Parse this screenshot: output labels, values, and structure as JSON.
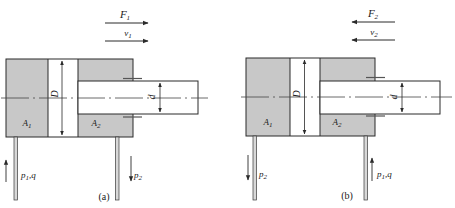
{
  "figure": {
    "colors": {
      "chamber_fill": "#c8c8c8",
      "line": "#2a2a2a",
      "background": "#ffffff"
    },
    "panels": [
      {
        "id": "a",
        "caption": "(a)",
        "force": {
          "symbol": "F",
          "subscript": "1",
          "direction": "right"
        },
        "velocity": {
          "symbol": "v",
          "subscript": "1",
          "direction": "right"
        },
        "bore_label": "D",
        "rod_label": "d",
        "rodless_chamber": {
          "symbol": "A",
          "subscript": "1"
        },
        "rod_chamber": {
          "symbol": "A",
          "subscript": "2"
        },
        "left_port": {
          "label": "p",
          "subscript": "1",
          "suffix": ",q",
          "flow": "in"
        },
        "right_port": {
          "label": "p",
          "subscript": "2",
          "suffix": "",
          "flow": "out"
        }
      },
      {
        "id": "b",
        "caption": "(b)",
        "force": {
          "symbol": "F",
          "subscript": "2",
          "direction": "left"
        },
        "velocity": {
          "symbol": "v",
          "subscript": "2",
          "direction": "left"
        },
        "bore_label": "D",
        "rod_label": "d",
        "rodless_chamber": {
          "symbol": "A",
          "subscript": "1"
        },
        "rod_chamber": {
          "symbol": "A",
          "subscript": "2"
        },
        "left_port": {
          "label": "p",
          "subscript": "2",
          "suffix": "",
          "flow": "out"
        },
        "right_port": {
          "label": "p",
          "subscript": "1",
          "suffix": ",q",
          "flow": "in"
        }
      }
    ]
  }
}
